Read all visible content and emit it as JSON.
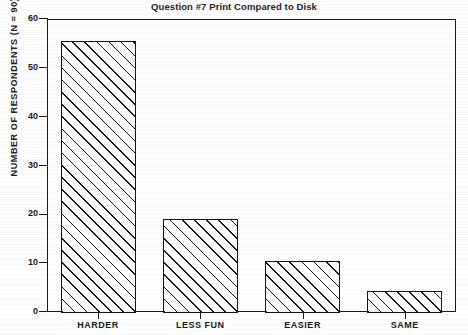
{
  "chart_data": {
    "type": "bar",
    "title": "Question #7 Print Compared to Disk",
    "xlabel": "",
    "ylabel": "NUMBER OF RESPONDENTS  (N = 90)",
    "categories": [
      "HARDER",
      "LESS FUN",
      "EASIER",
      "SAME"
    ],
    "values": [
      55.5,
      19,
      10.5,
      4.3
    ],
    "ylim": [
      0,
      60
    ],
    "ytick_labels": [
      "0",
      "10",
      "20",
      "30",
      "40",
      "50",
      "60"
    ],
    "ytick_values": [
      0,
      10,
      20,
      30,
      40,
      50,
      60
    ],
    "grid": false,
    "legend": null,
    "series": [
      {
        "name": "Respondents",
        "values": [
          55.5,
          19,
          10.5,
          4.3
        ]
      }
    ],
    "style": {
      "bar_fill": "hatched-diagonal",
      "bar_edge_color": "#151515",
      "background": "#ffffff",
      "frame": "box"
    }
  }
}
